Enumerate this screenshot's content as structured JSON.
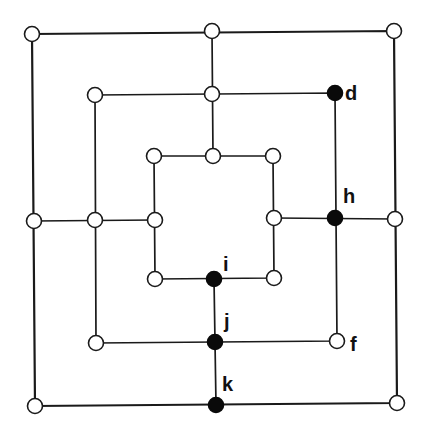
{
  "diagram": {
    "title": "",
    "type": "nine-mens-morris-board",
    "colors": {
      "line": "#1a1a1a",
      "empty_point": "#ffffff",
      "filled_point": "#0a0a0a",
      "background": "#ffffff"
    },
    "squares": [
      {
        "name": "outer",
        "corners": [
          [
            32,
            34
          ],
          [
            394,
            31
          ],
          [
            397,
            403
          ],
          [
            35,
            406
          ]
        ]
      },
      {
        "name": "middle",
        "corners": [
          [
            95,
            95
          ],
          [
            335,
            93
          ],
          [
            337,
            341
          ],
          [
            96,
            343
          ]
        ]
      },
      {
        "name": "inner",
        "corners": [
          [
            154,
            156
          ],
          [
            273,
            156
          ],
          [
            274,
            278
          ],
          [
            155,
            279
          ]
        ]
      }
    ],
    "connectors": [
      {
        "name": "top",
        "from": [
          212,
          31
        ],
        "to": [
          213,
          156
        ]
      },
      {
        "name": "bottom",
        "from": [
          214,
          279
        ],
        "to": [
          216,
          405
        ]
      },
      {
        "name": "left",
        "from": [
          34,
          221
        ],
        "to": [
          155,
          220
        ]
      },
      {
        "name": "right",
        "from": [
          274,
          218
        ],
        "to": [
          395,
          219
        ]
      }
    ],
    "points": [
      {
        "id": "outer-tl",
        "x": 32,
        "y": 34,
        "filled": false,
        "label": ""
      },
      {
        "id": "outer-tm",
        "x": 212,
        "y": 31,
        "filled": false,
        "label": ""
      },
      {
        "id": "outer-tr",
        "x": 394,
        "y": 31,
        "filled": false,
        "label": ""
      },
      {
        "id": "outer-ml",
        "x": 34,
        "y": 221,
        "filled": false,
        "label": ""
      },
      {
        "id": "outer-mr",
        "x": 395,
        "y": 219,
        "filled": false,
        "label": ""
      },
      {
        "id": "outer-bl",
        "x": 35,
        "y": 406,
        "filled": false,
        "label": ""
      },
      {
        "id": "outer-bm",
        "x": 216,
        "y": 405,
        "filled": true,
        "label": "k",
        "label_x": 222,
        "label_y": 391
      },
      {
        "id": "outer-br",
        "x": 397,
        "y": 403,
        "filled": false,
        "label": ""
      },
      {
        "id": "middle-tl",
        "x": 95,
        "y": 95,
        "filled": false,
        "label": ""
      },
      {
        "id": "middle-tm",
        "x": 212,
        "y": 94,
        "filled": false,
        "label": ""
      },
      {
        "id": "middle-tr",
        "x": 335,
        "y": 93,
        "filled": true,
        "label": "d",
        "label_x": 345,
        "label_y": 100
      },
      {
        "id": "middle-ml",
        "x": 95,
        "y": 220,
        "filled": false,
        "label": ""
      },
      {
        "id": "middle-mr",
        "x": 335,
        "y": 218,
        "filled": true,
        "label": "h",
        "label_x": 343,
        "label_y": 203
      },
      {
        "id": "middle-bl",
        "x": 96,
        "y": 343,
        "filled": false,
        "label": ""
      },
      {
        "id": "middle-bm",
        "x": 215,
        "y": 342,
        "filled": true,
        "label": "j",
        "label_x": 224,
        "label_y": 328
      },
      {
        "id": "middle-br",
        "x": 337,
        "y": 341,
        "filled": false,
        "label": "f",
        "label_x": 350,
        "label_y": 351
      },
      {
        "id": "inner-tl",
        "x": 154,
        "y": 156,
        "filled": false,
        "label": ""
      },
      {
        "id": "inner-tm",
        "x": 213,
        "y": 156,
        "filled": false,
        "label": ""
      },
      {
        "id": "inner-tr",
        "x": 273,
        "y": 156,
        "filled": false,
        "label": ""
      },
      {
        "id": "inner-ml",
        "x": 155,
        "y": 220,
        "filled": false,
        "label": ""
      },
      {
        "id": "inner-mr",
        "x": 274,
        "y": 218,
        "filled": false,
        "label": ""
      },
      {
        "id": "inner-bl",
        "x": 155,
        "y": 279,
        "filled": false,
        "label": ""
      },
      {
        "id": "inner-bm",
        "x": 214,
        "y": 279,
        "filled": true,
        "label": "i",
        "label_x": 223,
        "label_y": 271
      },
      {
        "id": "inner-br",
        "x": 274,
        "y": 278,
        "filled": false,
        "label": ""
      }
    ],
    "point_radius": 7.5,
    "labels": [
      "d",
      "h",
      "i",
      "j",
      "f",
      "k"
    ]
  }
}
